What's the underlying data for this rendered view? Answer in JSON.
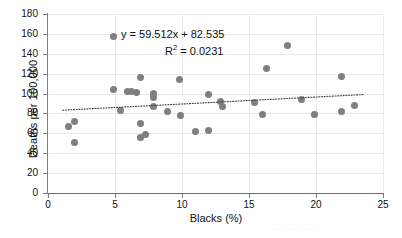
{
  "chart_data": {
    "type": "scatter",
    "title": "",
    "xlabel": "Blacks (%)",
    "ylabel": "Deaths per 100,000",
    "xlim": [
      0,
      25
    ],
    "ylim": [
      0,
      180
    ],
    "xticks": [
      0,
      5,
      10,
      15,
      20,
      25
    ],
    "yticks": [
      0,
      20,
      40,
      60,
      80,
      100,
      120,
      140,
      160,
      180
    ],
    "grid": true,
    "legend": "none",
    "marker_color": "#7f7f7f",
    "trendline": {
      "style": "dotted",
      "color": "#3f3f3f",
      "slope": 0.7,
      "intercept": 82.535,
      "x_start": 1.1,
      "x_end": 23.6,
      "equation_label": "y = 59.512x + 82.535",
      "r2_label": "R",
      "r2_sup": "2",
      "r2_value": " = 0.0231"
    },
    "points": [
      {
        "x": 1.5,
        "y": 67
      },
      {
        "x": 2.0,
        "y": 72
      },
      {
        "x": 2.0,
        "y": 51
      },
      {
        "x": 4.85,
        "y": 157
      },
      {
        "x": 4.9,
        "y": 104
      },
      {
        "x": 5.4,
        "y": 83
      },
      {
        "x": 5.9,
        "y": 102
      },
      {
        "x": 6.2,
        "y": 102
      },
      {
        "x": 6.6,
        "y": 101
      },
      {
        "x": 6.9,
        "y": 116
      },
      {
        "x": 6.9,
        "y": 70
      },
      {
        "x": 6.9,
        "y": 56
      },
      {
        "x": 7.3,
        "y": 59
      },
      {
        "x": 7.9,
        "y": 100
      },
      {
        "x": 7.9,
        "y": 96
      },
      {
        "x": 7.9,
        "y": 87
      },
      {
        "x": 8.9,
        "y": 82
      },
      {
        "x": 9.8,
        "y": 114
      },
      {
        "x": 9.9,
        "y": 78
      },
      {
        "x": 11.0,
        "y": 62
      },
      {
        "x": 12.0,
        "y": 99
      },
      {
        "x": 12.0,
        "y": 63
      },
      {
        "x": 12.9,
        "y": 92
      },
      {
        "x": 13.0,
        "y": 87
      },
      {
        "x": 15.4,
        "y": 91
      },
      {
        "x": 16.0,
        "y": 79
      },
      {
        "x": 16.3,
        "y": 125
      },
      {
        "x": 17.9,
        "y": 148
      },
      {
        "x": 18.9,
        "y": 94
      },
      {
        "x": 19.9,
        "y": 79
      },
      {
        "x": 21.9,
        "y": 117
      },
      {
        "x": 21.9,
        "y": 82
      },
      {
        "x": 22.9,
        "y": 88
      }
    ]
  },
  "artifact": {
    "bleed_text": "·· ·· ···· · ···· ··"
  }
}
